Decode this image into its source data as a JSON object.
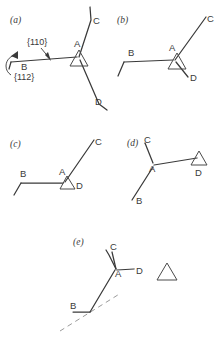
{
  "figure": {
    "background": "#ffffff",
    "ink": "#3a3a3a",
    "dash_color": "#9a9a9a",
    "panels": [
      {
        "id": "a",
        "label": "(a)",
        "vertices": [
          "A",
          "B",
          "C",
          "D"
        ],
        "annotations": [
          "{110}",
          "{112}"
        ],
        "has_triangle_marker": true,
        "has_rotation_arrow": true
      },
      {
        "id": "b",
        "label": "(b)",
        "vertices": [
          "A",
          "B",
          "C",
          "D"
        ],
        "annotations": [],
        "has_triangle_marker": true,
        "has_rotation_arrow": false
      },
      {
        "id": "c",
        "label": "(c)",
        "vertices": [
          "A",
          "B",
          "C",
          "D"
        ],
        "annotations": [],
        "has_triangle_marker": true,
        "has_rotation_arrow": false
      },
      {
        "id": "d",
        "label": "(d)",
        "vertices": [
          "A",
          "B",
          "C",
          "D"
        ],
        "annotations": [],
        "has_triangle_marker": true,
        "has_rotation_arrow": false
      },
      {
        "id": "e",
        "label": "(e)",
        "vertices": [
          "A",
          "B",
          "C",
          "D"
        ],
        "annotations": [],
        "has_triangle_marker": true,
        "has_rotation_arrow": false,
        "has_dashed_reference_line": true,
        "has_detached_triangle": true
      }
    ],
    "labels": {
      "panel_a": "(a)",
      "panel_b": "(b)",
      "panel_c": "(c)",
      "panel_d": "(d)",
      "panel_e": "(e)",
      "A": "A",
      "B": "B",
      "C": "C",
      "D": "D",
      "plane_110": "{110}",
      "plane_112": "{112}"
    }
  }
}
